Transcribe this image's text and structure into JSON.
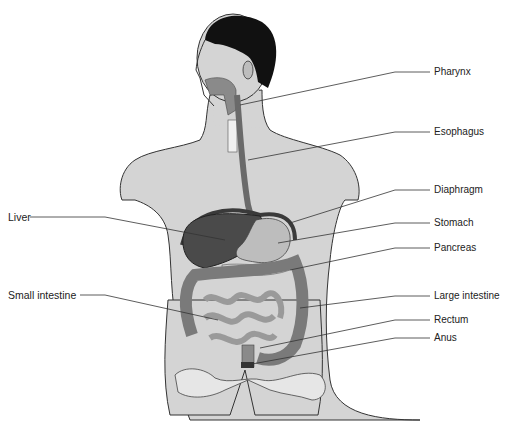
{
  "diagram": {
    "colors": {
      "body_fill": "#d4d4d4",
      "outline": "#333333",
      "hair": "#111111",
      "organ_dark": "#4a4a4a",
      "organ_mid": "#8a8a8a",
      "organ_light": "#bdbdbd",
      "bone": "#e6e6e6",
      "leader_line": "#333333"
    },
    "labels": [
      {
        "id": "pharynx",
        "text": "Pharynx",
        "side": "right"
      },
      {
        "id": "esophagus",
        "text": "Esophagus",
        "side": "right"
      },
      {
        "id": "diaphragm",
        "text": "Diaphragm",
        "side": "right"
      },
      {
        "id": "stomach",
        "text": "Stomach",
        "side": "right"
      },
      {
        "id": "pancreas",
        "text": "Pancreas",
        "side": "right"
      },
      {
        "id": "large-intestine",
        "text": "Large intestine",
        "side": "right"
      },
      {
        "id": "rectum",
        "text": "Rectum",
        "side": "right"
      },
      {
        "id": "anus",
        "text": "Anus",
        "side": "right"
      },
      {
        "id": "liver",
        "text": "Liver",
        "side": "left"
      },
      {
        "id": "small-intestine",
        "text": "Small intestine",
        "side": "left"
      }
    ]
  }
}
